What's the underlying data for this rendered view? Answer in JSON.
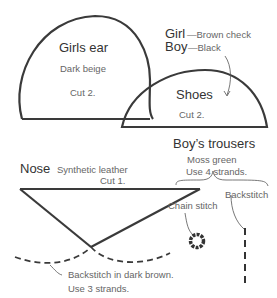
{
  "girls_ear": {
    "title": "Girls ear",
    "material": "Dark beige",
    "cut": "Cut 2."
  },
  "shoes": {
    "title": "Shoes",
    "cut": "Cut 2.",
    "girl_label": "Girl",
    "girl_material": "—Brown check",
    "boy_label": "Boy",
    "boy_material": "—Black"
  },
  "boys_trousers": {
    "title": "Boy’s trousers",
    "color": "Moss green",
    "strands": "Use 4 strands.",
    "chain_stitch": "Chain stitch",
    "backstitch": "Backstitch"
  },
  "nose": {
    "title": "Nose",
    "material": "Synthetic leather",
    "cut": "Cut 1.",
    "backstitch_note": "Backstitch in dark brown.",
    "strands": "Use 3 strands."
  }
}
